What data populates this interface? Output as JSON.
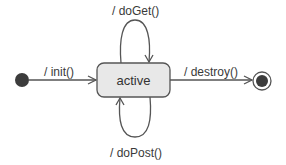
{
  "diagram": {
    "type": "uml-state-machine",
    "states": [
      {
        "id": "initial",
        "kind": "initial-pseudostate"
      },
      {
        "id": "active",
        "kind": "state",
        "label": "active"
      },
      {
        "id": "final",
        "kind": "final-state"
      }
    ],
    "transitions": [
      {
        "from": "initial",
        "to": "active",
        "label": "/ init()"
      },
      {
        "from": "active",
        "to": "active",
        "label": "/ doGet()",
        "placement": "above"
      },
      {
        "from": "active",
        "to": "active",
        "label": "/ doPost()",
        "placement": "below"
      },
      {
        "from": "active",
        "to": "final",
        "label": "/ destroy()"
      }
    ],
    "colors": {
      "state_fill": "#e8e8e8",
      "stroke": "#555555",
      "pseudostate_fill": "#3c3c3c",
      "background": "#ffffff"
    }
  }
}
